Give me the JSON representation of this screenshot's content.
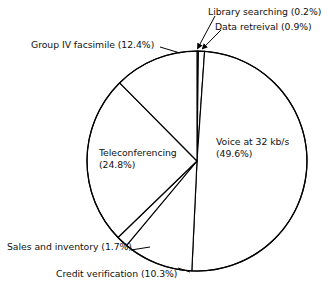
{
  "chart_data": {
    "type": "pie",
    "title": "",
    "subtitle": "",
    "xlabel": "",
    "ylabel": "",
    "legend_position": "none",
    "grid": false,
    "units": "percent",
    "start_angle_deg": 0,
    "direction": "clockwise-from-top",
    "categories": [
      "Library searching",
      "Data retreival",
      "Voice at 32 kb/s",
      "Credit verification",
      "Sales and inventory",
      "Teleconferencing",
      "Group IV facsimile"
    ],
    "values": [
      0.2,
      0.9,
      49.6,
      10.3,
      1.7,
      24.8,
      12.4
    ],
    "slices": [
      {
        "label": "Library searching",
        "value": 0.2,
        "value_text": "(0.2%)",
        "label_text": "Library searching (0.2%)"
      },
      {
        "label": "Data retreival",
        "value": 0.9,
        "value_text": "(0.9%)",
        "label_text": "Data retreival (0.9%)"
      },
      {
        "label": "Voice at 32 kb/s",
        "value": 49.6,
        "value_text": "(49.6%)",
        "label_text": "Voice at 32 kb/s (49.6%)"
      },
      {
        "label": "Credit verification",
        "value": 10.3,
        "value_text": "(10.3%)",
        "label_text": "Credit verification (10.3%)"
      },
      {
        "label": "Sales and inventory",
        "value": 1.7,
        "value_text": "(1.7%)",
        "label_text": "Sales and inventory (1.7%)"
      },
      {
        "label": "Teleconferencing",
        "value": 24.8,
        "value_text": "(24.8%)",
        "label_text": "Teleconferencing (24.8%)"
      },
      {
        "label": "Group IV facsimile",
        "value": 12.4,
        "value_text": "(12.4%)",
        "label_text": "Group IV facsimile (12.4%)"
      }
    ],
    "colors": {
      "slice_fill": "#ffffff",
      "slice_stroke": "#000000",
      "background": "#ffffff",
      "text": "#111111",
      "leader_line": "#000000"
    }
  },
  "labels": {
    "library_searching": "Library searching (0.2%)",
    "data_retrieval": "Data retreival (0.9%)",
    "group_iv_facsimile": "Group IV facsimile (12.4%)",
    "voice_line1": "Voice at 32 kb/s",
    "voice_line2": "(49.6%)",
    "teleconferencing_line1": "Teleconferencing",
    "teleconferencing_line2": "(24.8%)",
    "sales_and_inventory": "Sales and inventory (1.7%)",
    "credit_verification": "Credit verification (10.3%)"
  }
}
